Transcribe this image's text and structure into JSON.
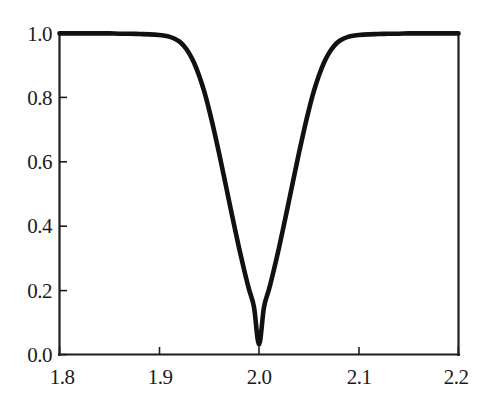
{
  "chart_data": {
    "type": "line",
    "title": "",
    "subtitle": "",
    "xlabel": "",
    "ylabel": "",
    "xlim": [
      1.8,
      2.2
    ],
    "ylim": [
      0.0,
      1.0
    ],
    "grid": false,
    "legend": null,
    "legend_position": "none",
    "annotations": [],
    "xticks": [
      1.8,
      1.9,
      2.0,
      2.1,
      2.2
    ],
    "xtick_labels": [
      "1.8",
      "1.9",
      "2.0",
      "2.1",
      "2.2"
    ],
    "yticks": [
      0.0,
      0.2,
      0.4,
      0.6,
      0.8,
      1.0
    ],
    "ytick_labels": [
      "0.0",
      "0.2",
      "0.4",
      "0.6",
      "0.8",
      "1.0"
    ],
    "series": [
      {
        "name": "transmission",
        "color": "#111111",
        "line_width": 4.6,
        "x": [
          1.8,
          1.81,
          1.82,
          1.83,
          1.84,
          1.85,
          1.86,
          1.87,
          1.88,
          1.89,
          1.9,
          1.905,
          1.91,
          1.915,
          1.92,
          1.925,
          1.93,
          1.935,
          1.94,
          1.945,
          1.95,
          1.955,
          1.96,
          1.965,
          1.97,
          1.975,
          1.98,
          1.985,
          1.99,
          1.995,
          2.0,
          2.005,
          2.01,
          2.015,
          2.02,
          2.025,
          2.03,
          2.035,
          2.04,
          2.045,
          2.05,
          2.055,
          2.06,
          2.065,
          2.07,
          2.075,
          2.08,
          2.085,
          2.09,
          2.095,
          2.1,
          2.11,
          2.12,
          2.13,
          2.14,
          2.15,
          2.16,
          2.17,
          2.18,
          2.19,
          2.2
        ],
        "y": [
          1.0,
          1.0,
          1.0,
          1.0,
          1.0,
          1.0,
          0.999,
          0.999,
          0.998,
          0.997,
          0.995,
          0.993,
          0.99,
          0.984,
          0.975,
          0.96,
          0.938,
          0.908,
          0.868,
          0.82,
          0.762,
          0.697,
          0.627,
          0.553,
          0.478,
          0.404,
          0.332,
          0.265,
          0.203,
          0.148,
          0.031,
          0.148,
          0.203,
          0.265,
          0.332,
          0.404,
          0.478,
          0.553,
          0.627,
          0.697,
          0.762,
          0.82,
          0.868,
          0.908,
          0.938,
          0.96,
          0.975,
          0.984,
          0.99,
          0.993,
          0.995,
          0.997,
          0.998,
          0.999,
          0.999,
          1.0,
          1.0,
          1.0,
          1.0,
          1.0,
          1.0
        ]
      }
    ],
    "minimum": {
      "x": 2.0,
      "y": 0.03
    },
    "baseline": 1.0
  },
  "axes": {
    "frame_color": "#1d1d1d",
    "background": "#ffffff",
    "tick_direction": "in"
  }
}
